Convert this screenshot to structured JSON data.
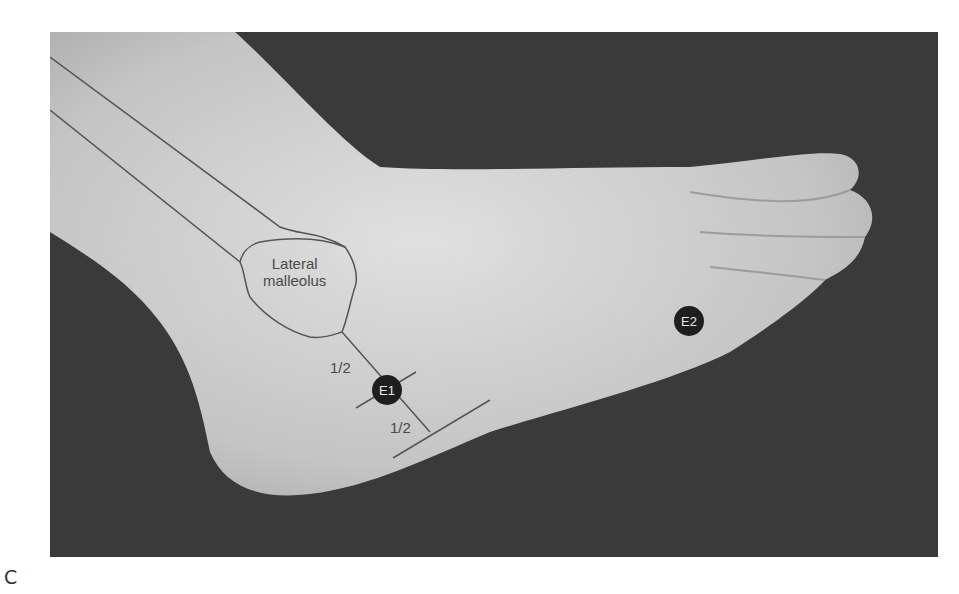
{
  "figure": {
    "panel_letter": "C",
    "colors": {
      "background": "#3a3a3a",
      "skin": "#cfcfcf",
      "line": "#555555",
      "marker": "#1e1e1e"
    },
    "labels": {
      "lateral_malleolus": "Lateral\nmalleolus",
      "half_upper": "1/2",
      "half_lower": "1/2"
    },
    "points": [
      {
        "id": "E1",
        "label": "E1"
      },
      {
        "id": "E2",
        "label": "E2"
      }
    ]
  }
}
